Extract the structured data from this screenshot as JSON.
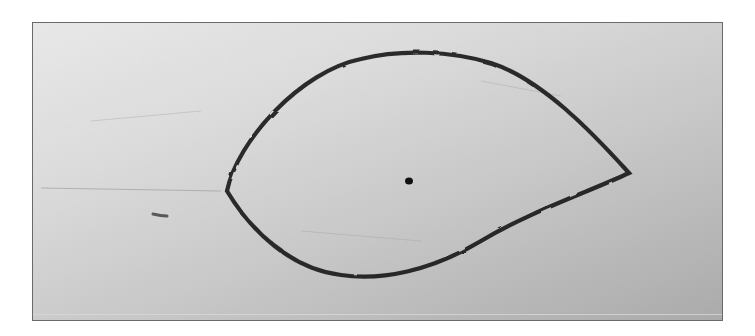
{
  "image": {
    "description": "Photograph of a hand-drawn closed teardrop/leaf-shaped curve on paper with a single dot inside",
    "colors": {
      "paper_light": "#ececec",
      "paper_dark": "#a9a9a9",
      "ink": "#1c1c1c",
      "frame_border": "#6a6a6a"
    },
    "shape": {
      "type": "closed-curve",
      "left_tip": [
        226,
        190
      ],
      "right_tip": [
        628,
        172
      ],
      "top": [
        410,
        52
      ],
      "bottom": [
        370,
        277
      ]
    },
    "dot": {
      "x": 408,
      "y": 180
    }
  }
}
